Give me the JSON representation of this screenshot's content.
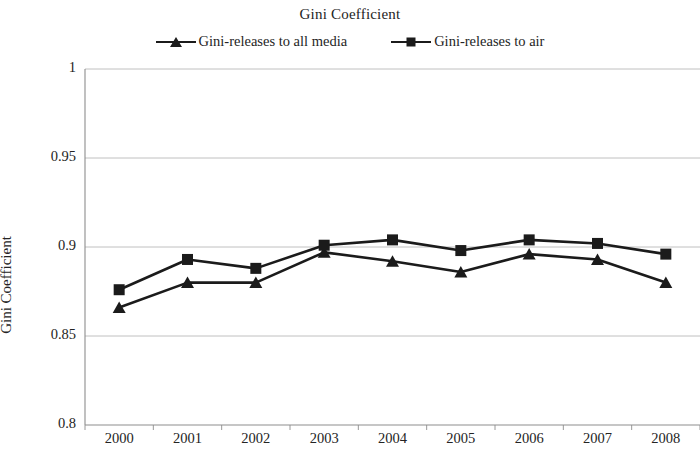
{
  "chart_data": {
    "type": "line",
    "title": "Gini Coefficient",
    "xlabel": "",
    "ylabel": "Gini Coefficient",
    "categories": [
      "2000",
      "2001",
      "2002",
      "2003",
      "2004",
      "2005",
      "2006",
      "2007",
      "2008"
    ],
    "ylim": [
      0.8,
      1
    ],
    "y_ticks": [
      "0.8",
      "0.85",
      "0.9",
      "0.95",
      "1"
    ],
    "y_tick_values": [
      0.8,
      0.85,
      0.9,
      0.95,
      1
    ],
    "grid": "horizontal",
    "legend_position": "top-center",
    "series": [
      {
        "name": "Gini-releases to all media",
        "marker": "triangle",
        "color": "#1b1b1b",
        "values": [
          0.866,
          0.88,
          0.88,
          0.897,
          0.892,
          0.886,
          0.896,
          0.893,
          0.88
        ]
      },
      {
        "name": "Gini-releases to air",
        "marker": "square",
        "color": "#1b1b1b",
        "values": [
          0.876,
          0.893,
          0.888,
          0.901,
          0.904,
          0.898,
          0.904,
          0.902,
          0.896
        ]
      }
    ]
  },
  "legend": {
    "entries": [
      {
        "label": "Gini-releases to all media",
        "marker": "triangle-marker"
      },
      {
        "label": "Gini-releases to air",
        "marker": "square-marker"
      }
    ]
  }
}
